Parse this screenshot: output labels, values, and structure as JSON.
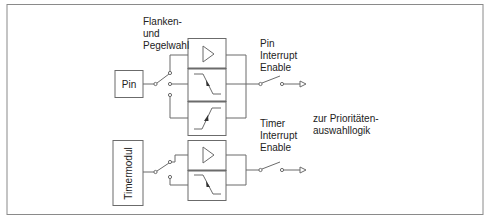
{
  "diagram": {
    "labels": {
      "edge_level_select": [
        "Flanken-",
        "und",
        "Pegelwahl"
      ],
      "pin_interrupt_enable": [
        "Pin",
        "Interrupt",
        "Enable"
      ],
      "timer_interrupt_enable": [
        "Timer",
        "Interrupt",
        "Enable"
      ],
      "to_priority_logic": [
        "zur Prioritäten-",
        "auswahllogik"
      ]
    },
    "blocks": {
      "pin": "Pin",
      "timer_module": "Timermodul"
    },
    "top_stage": {
      "cells": [
        "level-buffer-icon",
        "falling-edge-icon",
        "rising-edge-icon"
      ]
    },
    "bottom_stage": {
      "cells": [
        "level-buffer-icon",
        "falling-edge-icon"
      ]
    },
    "colors": {
      "line": "#6b6b6b",
      "frame": "#8a8a8a",
      "text": "#222222"
    }
  }
}
